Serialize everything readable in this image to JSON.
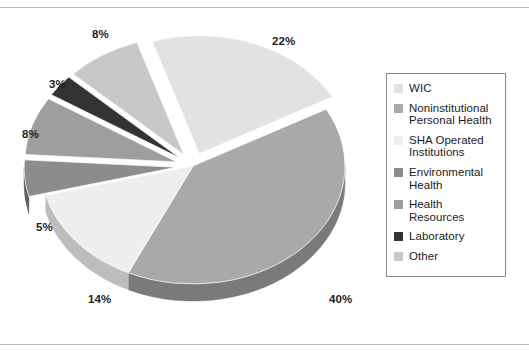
{
  "chart_data": {
    "type": "pie",
    "title": "",
    "subtitle": "",
    "xlabel": "",
    "ylabel": "",
    "style": "3d-exploded-pie",
    "units": "percent",
    "legend_position": "right",
    "grid": false,
    "categories": [
      "WIC",
      "Noninstitutional Personal Health",
      "SHA Operated Institutions",
      "Environmental Health",
      "Health Resources",
      "Laboratory",
      "Other"
    ],
    "values": [
      22,
      40,
      14,
      5,
      8,
      3,
      8
    ],
    "labels": [
      "22%",
      "40%",
      "14%",
      "5%",
      "8%",
      "3%",
      "8%"
    ],
    "colors": [
      "#e2e2e2",
      "#a9a9a9",
      "#eeeeee",
      "#8c8c8c",
      "#9e9e9e",
      "#333333",
      "#c8c8c8"
    ],
    "slices": [
      {
        "label": "WIC",
        "value": 22,
        "display": "22%",
        "color": "#e2e2e2",
        "side_color": "#b4b4b4",
        "exploded": true
      },
      {
        "label": "Noninstitutional Personal Health",
        "value": 40,
        "display": "40%",
        "color": "#a9a9a9",
        "side_color": "#7a7a7a",
        "exploded": false
      },
      {
        "label": "SHA Operated Institutions",
        "value": 14,
        "display": "14%",
        "color": "#eeeeee",
        "side_color": "#bdbdbd",
        "exploded": false
      },
      {
        "label": "Environmental Health",
        "value": 5,
        "display": "5%",
        "color": "#8c8c8c",
        "side_color": "#5e5e5e",
        "exploded": true
      },
      {
        "label": "Health Resources",
        "value": 8,
        "display": "8%",
        "color": "#9e9e9e",
        "side_color": "#6e6e6e",
        "exploded": true
      },
      {
        "label": "Laboratory",
        "value": 3,
        "display": "3%",
        "color": "#333333",
        "side_color": "#141414",
        "exploded": true
      },
      {
        "label": "Other",
        "value": 8,
        "display": "8%",
        "color": "#c8c8c8",
        "side_color": "#989898",
        "exploded": true
      }
    ]
  },
  "legend": {
    "items": [
      {
        "label": "WIC",
        "color": "#e2e2e2"
      },
      {
        "label": "Noninstitutional Personal Health",
        "color": "#a9a9a9"
      },
      {
        "label": "SHA Operated Institutions",
        "color": "#eeeeee"
      },
      {
        "label": "Environmental Health",
        "color": "#8c8c8c"
      },
      {
        "label": "Health Resources",
        "color": "#9e9e9e"
      },
      {
        "label": "Laboratory",
        "color": "#333333"
      },
      {
        "label": "Other",
        "color": "#c8c8c8"
      }
    ]
  },
  "data_labels": [
    {
      "name": "pct-22",
      "text": "22%",
      "x": 272,
      "y": 27
    },
    {
      "name": "pct-40",
      "text": "40%",
      "x": 329,
      "y": 285
    },
    {
      "name": "pct-14",
      "text": "14%",
      "x": 88,
      "y": 285
    },
    {
      "name": "pct-5",
      "text": "5%",
      "x": 36,
      "y": 213
    },
    {
      "name": "pct-8-left",
      "text": "8%",
      "x": 22,
      "y": 120
    },
    {
      "name": "pct-3",
      "text": "3%",
      "x": 49,
      "y": 70
    },
    {
      "name": "pct-8-top",
      "text": "8%",
      "x": 92,
      "y": 20
    }
  ],
  "colors": {
    "background": "#ffffff",
    "rule": "#b9b9b9",
    "legend_border": "#8a8a8a",
    "text": "#1b1b1b"
  }
}
